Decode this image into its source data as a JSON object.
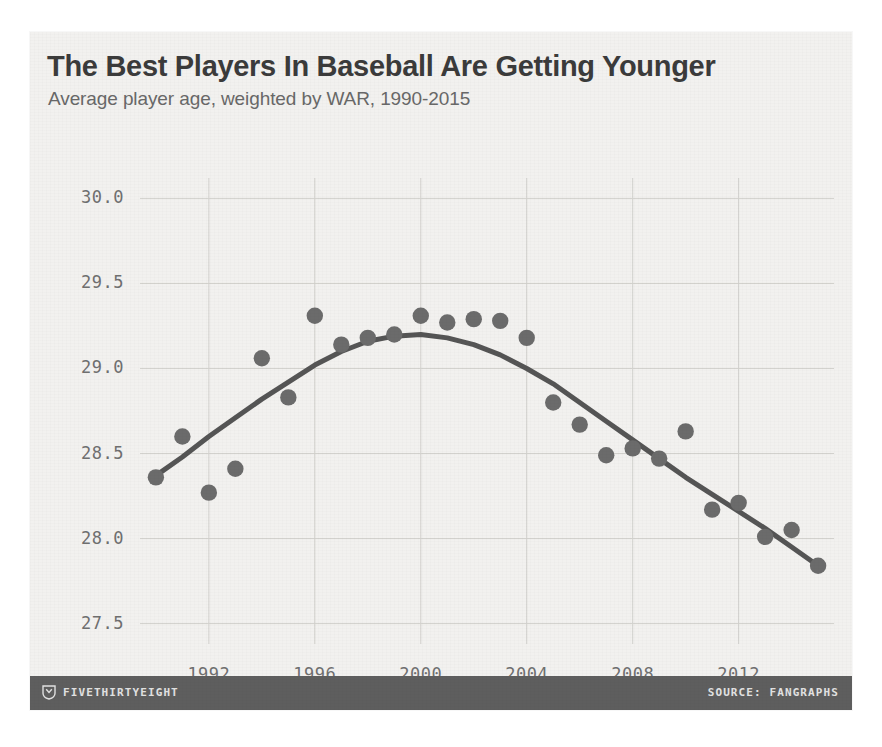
{
  "figure": {
    "background_color": "#f2f1ef",
    "footer_color": "#5e5e5e",
    "marker_color": "#6b6b6b",
    "trend_color": "#555555",
    "grid_color": "#d2d1cd"
  },
  "footer": {
    "brand": "FIVETHIRTYEIGHT",
    "logo_icon": "fivethirtyeight-shield-icon",
    "source": "SOURCE: FANGRAPHS"
  },
  "chart_data": {
    "type": "scatter",
    "title": "The Best Players In Baseball Are Getting Younger",
    "subtitle": "Average player age, weighted by WAR, 1990-2015",
    "xlabel": "",
    "ylabel": "",
    "xlim": [
      1989.4,
      2015.6
    ],
    "ylim": [
      27.38,
      30.12
    ],
    "grid": true,
    "legend": false,
    "ytick_labels": [
      "30.0",
      "29.5",
      "29.0",
      "28.5",
      "28.0",
      "27.5"
    ],
    "yticks": [
      30.0,
      29.5,
      29.0,
      28.5,
      28.0,
      27.5
    ],
    "xtick_labels": [
      "1992",
      "1996",
      "2000",
      "2004",
      "2008",
      "2012"
    ],
    "xticks": [
      1992,
      1996,
      2000,
      2004,
      2008,
      2012
    ],
    "x": [
      1990,
      1991,
      1992,
      1993,
      1994,
      1995,
      1996,
      1997,
      1998,
      1999,
      2000,
      2001,
      2002,
      2003,
      2004,
      2005,
      2006,
      2007,
      2008,
      2009,
      2010,
      2011,
      2012,
      2013,
      2014,
      2015
    ],
    "values": [
      28.36,
      28.6,
      28.27,
      28.41,
      29.06,
      28.83,
      29.31,
      29.14,
      29.18,
      29.2,
      29.31,
      29.27,
      29.29,
      29.28,
      29.18,
      28.8,
      28.67,
      28.49,
      28.53,
      28.47,
      28.63,
      28.17,
      28.21,
      28.01,
      28.05,
      27.84
    ],
    "series": [
      {
        "name": "Average player age, weighted by WAR",
        "values": [
          28.36,
          28.6,
          28.27,
          28.41,
          29.06,
          28.83,
          29.31,
          29.14,
          29.18,
          29.2,
          29.31,
          29.27,
          29.29,
          29.28,
          29.18,
          28.8,
          28.67,
          28.49,
          28.53,
          28.47,
          28.63,
          28.17,
          28.21,
          28.01,
          28.05,
          27.84
        ]
      }
    ],
    "trend": {
      "name": "smoothed trend",
      "x": [
        1990,
        1991,
        1992,
        1993,
        1994,
        1995,
        1996,
        1997,
        1998,
        1999,
        2000,
        2001,
        2002,
        2003,
        2004,
        2005,
        2006,
        2007,
        2008,
        2009,
        2010,
        2011,
        2012,
        2013,
        2014,
        2015
      ],
      "values": [
        28.37,
        28.48,
        28.6,
        28.71,
        28.82,
        28.92,
        29.02,
        29.1,
        29.16,
        29.19,
        29.2,
        29.18,
        29.14,
        29.08,
        29.0,
        28.91,
        28.8,
        28.69,
        28.58,
        28.47,
        28.36,
        28.26,
        28.16,
        28.06,
        27.95,
        27.84
      ]
    }
  }
}
